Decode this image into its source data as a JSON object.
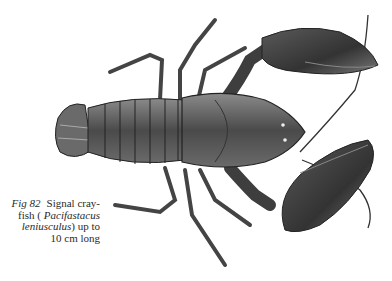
{
  "figure": {
    "label": "Fig 82",
    "caption_lines": [
      {
        "prefix": "Signal cray-"
      },
      {
        "prefix": "fish (",
        "italic": "Pacifastacus"
      },
      {
        "italic": "leniusculus",
        "suffix": ") up to"
      },
      {
        "prefix": "10 cm long"
      }
    ],
    "common_name": "Signal crayfish",
    "scientific_name": "Pacifastacus leniusculus",
    "size_note": "up to 10 cm long",
    "illustration": "crayfish-drawing",
    "colors": {
      "ink": "#2a2a2a",
      "shell_dark": "#3a3a3a",
      "shell_mid": "#6e6e6e",
      "shell_light": "#a8a8a8",
      "paper": "#ffffff"
    }
  }
}
